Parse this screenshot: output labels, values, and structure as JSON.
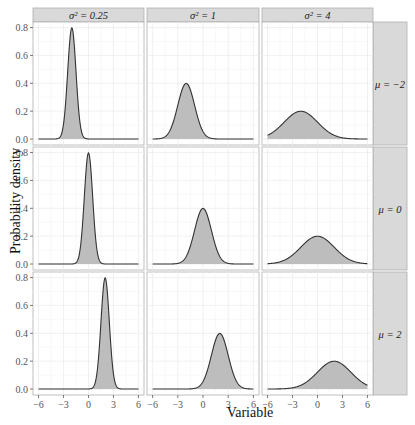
{
  "chart_data": {
    "type": "area",
    "title": "",
    "xlabel": "Variable",
    "ylabel": "Probability density",
    "xlim": [
      -6,
      6
    ],
    "ylim": [
      0,
      0.8
    ],
    "x_ticks": [
      "-6",
      "-3",
      "0",
      "3",
      "6"
    ],
    "y_ticks": [
      "0.0",
      "0.2",
      "0.4",
      "0.6",
      "0.8"
    ],
    "grid": true,
    "facet_cols": {
      "variable": "sigma^2",
      "labels": [
        "σ² = 0.25",
        "σ² = 1",
        "σ² = 4"
      ],
      "values": [
        0.25,
        1,
        4
      ]
    },
    "facet_rows": {
      "variable": "mu",
      "labels": [
        "μ = −2",
        "μ = 0",
        "μ = 2"
      ],
      "values": [
        -2,
        0,
        2
      ]
    },
    "series_description": "Normal probability density curves with grey shaded area under each curve; one panel per (mu, sigma^2) combination",
    "panels": [
      {
        "mu": -2,
        "variance": 0.25,
        "peak_x": -2,
        "peak_density": 0.8
      },
      {
        "mu": -2,
        "variance": 1,
        "peak_x": -2,
        "peak_density": 0.4
      },
      {
        "mu": -2,
        "variance": 4,
        "peak_x": -2,
        "peak_density": 0.2
      },
      {
        "mu": 0,
        "variance": 0.25,
        "peak_x": 0,
        "peak_density": 0.8
      },
      {
        "mu": 0,
        "variance": 1,
        "peak_x": 0,
        "peak_density": 0.4
      },
      {
        "mu": 0,
        "variance": 4,
        "peak_x": 0,
        "peak_density": 0.2
      },
      {
        "mu": 2,
        "variance": 0.25,
        "peak_x": 2,
        "peak_density": 0.8
      },
      {
        "mu": 2,
        "variance": 1,
        "peak_x": 2,
        "peak_density": 0.4
      },
      {
        "mu": 2,
        "variance": 4,
        "peak_x": 2,
        "peak_density": 0.2
      }
    ],
    "colors": {
      "fill": "#bdbdbd",
      "line": "#333333",
      "strip_bg": "#d9d9d9",
      "panel_border": "#b0b0b0",
      "grid": "#ececec"
    }
  },
  "labels": {
    "xlabel": "Variable",
    "ylabel": "Probability density"
  }
}
